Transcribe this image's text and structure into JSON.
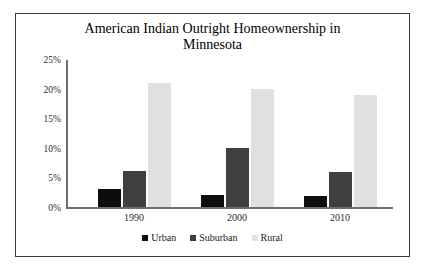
{
  "chart_data": {
    "type": "bar",
    "title": "American Indian Outright Homeownership in Minnesota",
    "title_line1": "American Indian Outright Homeownership in",
    "title_line2": "Minnesota",
    "xlabel": "",
    "ylabel": "",
    "categories": [
      "1990",
      "2000",
      "2010"
    ],
    "series": [
      {
        "name": "Urban",
        "color": "#0d0d0d",
        "values": [
          3,
          2,
          1.8
        ]
      },
      {
        "name": "Suburban",
        "color": "#404040",
        "values": [
          6,
          10,
          5.8
        ]
      },
      {
        "name": "Rural",
        "color": "#e0e0e0",
        "values": [
          21,
          20,
          19
        ]
      }
    ],
    "ylim": [
      0,
      25
    ],
    "ytick_labels": [
      "25%",
      "20%",
      "15%",
      "10%",
      "5%",
      "0%"
    ],
    "ytick_values": [
      25,
      20,
      15,
      10,
      5,
      0
    ],
    "grid": false,
    "legend_position": "bottom",
    "border_color": "#3a3a3a",
    "axis_color": "#6e6e6e"
  }
}
